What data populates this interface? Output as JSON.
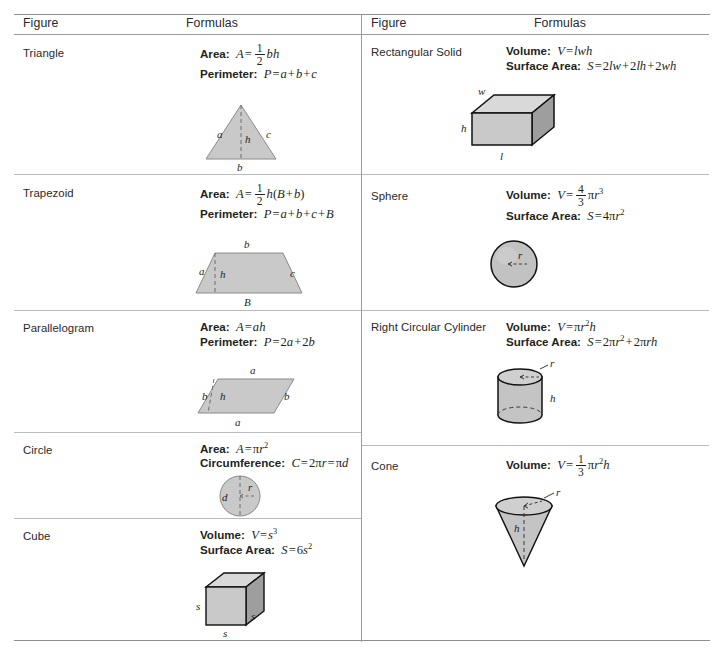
{
  "table": {
    "headers": {
      "figure": "Figure",
      "formulas": "Formulas"
    },
    "left_column": [
      {
        "figure": "Triangle",
        "formulas": [
          {
            "label": "Area:",
            "expr": "A = 1/2 bh"
          },
          {
            "label": "Perimeter:",
            "expr": "P = a + b + c"
          }
        ],
        "diagram": "triangle",
        "diagram_labels": [
          "a",
          "h",
          "c",
          "b"
        ]
      },
      {
        "figure": "Trapezoid",
        "formulas": [
          {
            "label": "Area:",
            "expr": "A = 1/2 h(B + b)"
          },
          {
            "label": "Perimeter:",
            "expr": "P = a + b + c + B"
          }
        ],
        "diagram": "trapezoid",
        "diagram_labels": [
          "b",
          "a",
          "h",
          "c",
          "B"
        ]
      },
      {
        "figure": "Parallelogram",
        "formulas": [
          {
            "label": "Area:",
            "expr": "A = ah"
          },
          {
            "label": "Perimeter:",
            "expr": "P = 2a + 2b"
          }
        ],
        "diagram": "parallelogram",
        "diagram_labels": [
          "a",
          "b",
          "h",
          "b",
          "a"
        ]
      },
      {
        "figure": "Circle",
        "formulas": [
          {
            "label": "Area:",
            "expr": "A = πr²"
          },
          {
            "label": "Circumference:",
            "expr": "C = 2πr = πd"
          }
        ],
        "diagram": "circle",
        "diagram_labels": [
          "d",
          "r"
        ]
      },
      {
        "figure": "Cube",
        "formulas": [
          {
            "label": "Volume:",
            "expr": "V = s³"
          },
          {
            "label": "Surface Area:",
            "expr": "S = 6s²"
          }
        ],
        "diagram": "cube",
        "diagram_labels": [
          "s",
          "s",
          "s"
        ]
      }
    ],
    "right_column": [
      {
        "figure": "Rectangular Solid",
        "formulas": [
          {
            "label": "Volume:",
            "expr": "V = lwh"
          },
          {
            "label": "Surface Area:",
            "expr": "S = 2lw + 2lh + 2wh"
          }
        ],
        "diagram": "rectangular-solid",
        "diagram_labels": [
          "w",
          "h",
          "l"
        ]
      },
      {
        "figure": "Sphere",
        "formulas": [
          {
            "label": "Volume:",
            "expr": "V = 4/3 πr³"
          },
          {
            "label": "Surface Area:",
            "expr": "S = 4πr²"
          }
        ],
        "diagram": "sphere",
        "diagram_labels": [
          "r"
        ]
      },
      {
        "figure": "Right Circular Cylinder",
        "formulas": [
          {
            "label": "Volume:",
            "expr": "V = πr²h"
          },
          {
            "label": "Surface Area:",
            "expr": "S = 2πr² + 2πrh"
          }
        ],
        "diagram": "cylinder",
        "diagram_labels": [
          "r",
          "h"
        ]
      },
      {
        "figure": "Cone",
        "formulas": [
          {
            "label": "Volume:",
            "expr": "V = 1/3 πr²h"
          }
        ],
        "diagram": "cone",
        "diagram_labels": [
          "r",
          "h"
        ]
      }
    ]
  },
  "labels": {
    "area": "Area:",
    "perimeter": "Perimeter:",
    "volume": "Volume:",
    "surface_area": "Surface Area:",
    "circumference": "Circumference:",
    "triangle": "Triangle",
    "trapezoid": "Trapezoid",
    "parallelogram": "Parallelogram",
    "circle": "Circle",
    "cube": "Cube",
    "rect_solid": "Rectangular Solid",
    "sphere": "Sphere",
    "cylinder": "Right Circular Cylinder",
    "cone": "Cone",
    "a": "a",
    "b": "b",
    "c": "c",
    "h": "h",
    "r": "r",
    "d": "d",
    "s": "s",
    "w": "w",
    "l": "l",
    "B": "B",
    "one": "1",
    "two": "2",
    "three": "3",
    "four": "4"
  },
  "colors": {
    "shape_fill": "#c9c9c9",
    "shape_fill_light": "#d9d9d9",
    "shape_fill_dark": "#9e9e9e",
    "shape_stroke": "#111111",
    "flat_stroke": "#8a8a8a",
    "rule": "#9a9c9f",
    "row_rule": "#b9bbbd",
    "text": "#231f20"
  }
}
